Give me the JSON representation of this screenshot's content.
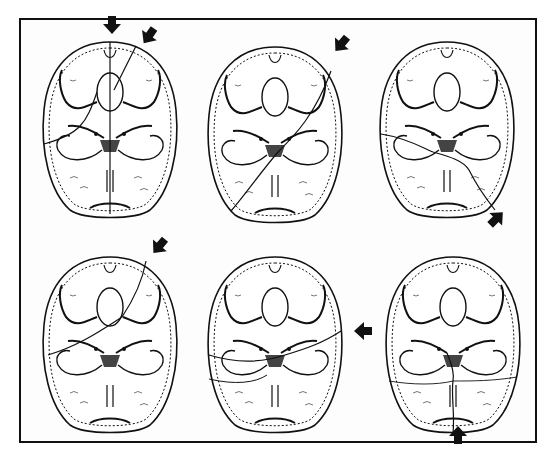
{
  "figure": {
    "layout": {
      "rows": 2,
      "cols": 3
    },
    "colors": {
      "ink": "#111111",
      "paper": "#ffffff"
    },
    "panels": [
      {
        "id": 1,
        "row": 1,
        "col": 1,
        "arrows": [
          "top-center (pointing down)",
          "upper-right (pointing down-left)"
        ],
        "fracture": "midline sagittal line from frontal through foramen magnum to occipital, plus oblique line from upper right frontal across middle fossa to left lateral"
      },
      {
        "id": 2,
        "row": 1,
        "col": 2,
        "arrows": [
          "upper-right (pointing down-left)"
        ],
        "fracture": "diagonal line from right frontal across petrous region to lower left occipital"
      },
      {
        "id": 3,
        "row": 1,
        "col": 3,
        "arrows": [
          "lower-right (pointing up-left)"
        ],
        "fracture": "line from lower right occipital across petrous apex to left temporal"
      },
      {
        "id": 4,
        "row": 2,
        "col": 1,
        "arrows": [
          "upper-right (pointing down-left)"
        ],
        "fracture": "oblique line from right frontal across anterior fossa to left middle fossa"
      },
      {
        "id": 5,
        "row": 2,
        "col": 2,
        "arrows": [
          "right side (pointing left)"
        ],
        "fracture": "transverse line from right temporal across middle fossae to left temporal"
      },
      {
        "id": 6,
        "row": 2,
        "col": 3,
        "arrows": [
          "bottom-center (pointing up)"
        ],
        "fracture": "line from occipital midline upward to foramen magnum region"
      }
    ]
  }
}
